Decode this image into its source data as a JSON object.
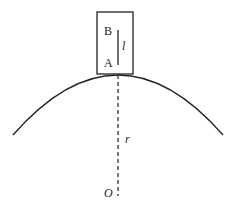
{
  "diagram": {
    "labels": {
      "point_b": "B",
      "point_a": "A",
      "length": "l",
      "radius": "r",
      "center": "O"
    },
    "colors": {
      "stroke": "#222222",
      "background": "#ffffff"
    }
  }
}
